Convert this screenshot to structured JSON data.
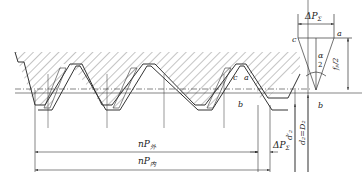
{
  "diagram": {
    "type": "thread-pitch-error-diagram",
    "labels": {
      "delta_p_top": "ΔP",
      "delta_p_top_sub": "Σ",
      "point_a_triangle": "a",
      "point_c_triangle": "c",
      "point_b_triangle": "b",
      "alpha": "α",
      "two": "2",
      "fp_half": "fₚ/2",
      "point_a_thread": "a",
      "point_c_thread": "c",
      "point_b_thread": "b",
      "np_outer": "nP",
      "np_outer_sub": "外",
      "np_inner": "nP",
      "np_inner_sub": "内",
      "delta_p_bottom": "ΔP",
      "delta_p_bottom_sub": "Σ",
      "d2_prime": "d′₂",
      "d2_eq_D2": "d₂=D₂"
    },
    "colors": {
      "line": "#333333",
      "hatch": "#555555",
      "background": "#ffffff"
    }
  }
}
